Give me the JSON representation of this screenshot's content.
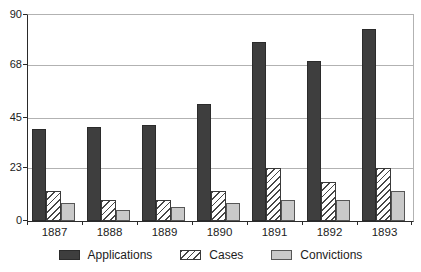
{
  "chart_data": {
    "type": "bar",
    "title": "",
    "xlabel": "",
    "ylabel": "",
    "categories": [
      "1887",
      "1888",
      "1889",
      "1890",
      "1891",
      "1892",
      "1893"
    ],
    "series": [
      {
        "name": "Applications",
        "style": "solid-dark",
        "color": "#3e3e3e",
        "values": [
          40,
          41,
          42,
          51,
          78,
          70,
          84
        ]
      },
      {
        "name": "Cases",
        "style": "hatched",
        "color": "#ffffff",
        "hatch_color": "#474747",
        "values": [
          13,
          9,
          9,
          13,
          23,
          17,
          23
        ]
      },
      {
        "name": "Convictions",
        "style": "solid-light",
        "color": "#c9c9c9",
        "values": [
          8,
          5,
          6,
          8,
          9,
          9,
          13
        ]
      }
    ],
    "y_ticks": [
      0,
      23,
      45,
      68,
      90
    ],
    "ylim": [
      0,
      90
    ],
    "grid": true,
    "legend_position": "bottom",
    "colors": {
      "gridline": "#b2b2b2",
      "axis": "#2a2a2a",
      "text": "#1c1c1c",
      "background": "#ffffff"
    }
  }
}
